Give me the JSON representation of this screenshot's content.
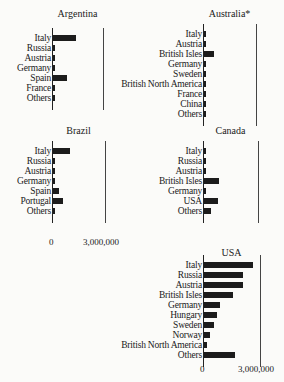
{
  "chart_data": [
    {
      "type": "bar",
      "orientation": "horizontal",
      "title": "Argentina",
      "categories": [
        "Italy",
        "Russia",
        "Austria",
        "Germany",
        "Spain",
        "France",
        "Others"
      ],
      "values": [
        1350000,
        100000,
        50000,
        60000,
        800000,
        70000,
        120000
      ],
      "xlim": [
        0,
        3000000
      ],
      "xticks": [
        "0",
        "3,000,000"
      ],
      "ref_line": 3000000
    },
    {
      "type": "bar",
      "orientation": "horizontal",
      "title": "Australia*",
      "categories": [
        "Italy",
        "Austria",
        "British Isles",
        "Germany",
        "Sweden",
        "British North America",
        "France",
        "China",
        "Others"
      ],
      "values": [
        60000,
        40000,
        550000,
        50000,
        30000,
        40000,
        30000,
        40000,
        50000
      ],
      "xlim": [
        0,
        3000000
      ],
      "xticks": [
        "0",
        "3,000,000"
      ],
      "ref_line": 3000000
    },
    {
      "type": "bar",
      "orientation": "horizontal",
      "title": "Brazil",
      "categories": [
        "Italy",
        "Russia",
        "Austria",
        "Germany",
        "Spain",
        "Portugal",
        "Others"
      ],
      "values": [
        950000,
        40000,
        60000,
        60000,
        350000,
        550000,
        100000
      ],
      "xlim": [
        0,
        3000000
      ],
      "xticks": [
        "0",
        "3,000,000"
      ],
      "ref_line": 3000000
    },
    {
      "type": "bar",
      "orientation": "horizontal",
      "title": "Canada",
      "categories": [
        "Italy",
        "Russia",
        "Austria",
        "British Isles",
        "Germany",
        "USA",
        "Others"
      ],
      "values": [
        80000,
        70000,
        60000,
        800000,
        40000,
        750000,
        400000
      ],
      "xlim": [
        0,
        3000000
      ],
      "xticks": [
        "0",
        "3,000,000"
      ],
      "ref_line": 3000000
    },
    {
      "type": "bar",
      "orientation": "horizontal",
      "title": "USA",
      "categories": [
        "Italy",
        "Russia",
        "Austria",
        "British Isles",
        "Germany",
        "Hungary",
        "Sweden",
        "Norway",
        "British North America",
        "Others"
      ],
      "values": [
        2600000,
        2050000,
        2050000,
        1500000,
        850000,
        700000,
        500000,
        300000,
        150000,
        1650000
      ],
      "xlim": [
        0,
        3000000
      ],
      "xticks": [
        "0",
        "3,000,000"
      ],
      "ref_line": 3000000
    }
  ],
  "panels": [
    {
      "title": "Argentina",
      "axis_x": 52,
      "ref_x": 103,
      "title_y": 8,
      "top": 34,
      "rows": [
        "Italy",
        "Russia",
        "Austria",
        "Germany",
        "Spain",
        "France",
        "Others"
      ],
      "show_ticks": false
    },
    {
      "title": "Australia*",
      "axis_x": 203,
      "ref_x": 256,
      "title_y": 8,
      "top": 30,
      "rows": [
        "Italy",
        "Austria",
        "British Isles",
        "Germany",
        "Sweden",
        "British North America",
        "France",
        "China",
        "Others"
      ],
      "show_ticks": false
    },
    {
      "title": "Brazil",
      "axis_x": 52,
      "ref_x": 105,
      "title_y": 125,
      "top": 147,
      "rows": [
        "Italy",
        "Russia",
        "Austria",
        "Germany",
        "Spain",
        "Portugal",
        "Others"
      ],
      "show_ticks": true,
      "tick_y": 237
    },
    {
      "title": "Canada",
      "axis_x": 203,
      "ref_x": 258,
      "title_y": 125,
      "top": 147,
      "rows": [
        "Italy",
        "Russia",
        "Austria",
        "British Isles",
        "Germany",
        "USA",
        "Others"
      ],
      "show_ticks": false
    },
    {
      "title": "USA",
      "axis_x": 203,
      "ref_x": 260,
      "title_y": 247,
      "top": 261,
      "rows": [
        "Italy",
        "Russia",
        "Austria",
        "British Isles",
        "Germany",
        "Hungary",
        "Sweden",
        "Norway",
        "British North America",
        "Others"
      ],
      "show_ticks": true,
      "tick_y": 364
    }
  ],
  "axis_labels": {
    "zero": "0",
    "max": "3,000,000"
  }
}
